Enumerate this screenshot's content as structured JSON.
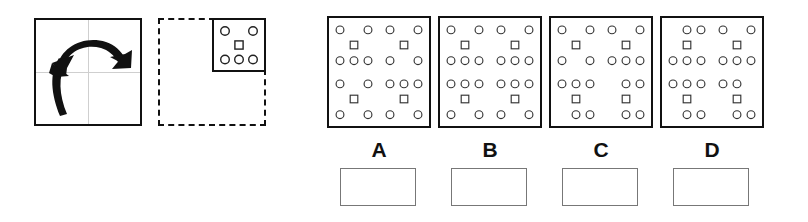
{
  "page": {
    "background_color": "#ffffff",
    "ink_color": "#111111",
    "glyph_color": "#333333",
    "answer_box_border_color": "#777777"
  },
  "prompt": {
    "rotation_box": {
      "name": "rotation-instruction-box",
      "border_style": "solid",
      "description": "Square frame containing two bold curved arrows indicating rotation",
      "arrow_count": 2,
      "arrows": [
        {
          "name": "upper-clockwise-arrow",
          "direction": "clockwise-right"
        },
        {
          "name": "lower-counterclockwise-arrow",
          "direction": "counterclockwise-up"
        }
      ],
      "axes_visible": true
    },
    "target_box": {
      "name": "dashed-target-box",
      "border_style": "dashed",
      "description": "Dashed square with a solid motif cell in the top-right quadrant",
      "motif_position": "top-right"
    }
  },
  "motif": {
    "name": "base-motif",
    "rows": [
      {
        "shape": "circle",
        "count": 2,
        "slots": [
          0,
          2
        ]
      },
      {
        "shape": "square",
        "count": 1,
        "slots": [
          1
        ]
      },
      {
        "shape": "circle",
        "count": 3,
        "slots": [
          0,
          1,
          2
        ]
      }
    ]
  },
  "options": [
    {
      "label": "A",
      "name": "option-a",
      "answer_box_value": "",
      "answer_box_placeholder": "",
      "quadrants": [
        {
          "name": "top-left",
          "rows": [
            {
              "shape": "circle",
              "slots": [
                0,
                2
              ]
            },
            {
              "shape": "square",
              "slots": [
                1
              ]
            },
            {
              "shape": "circle",
              "slots": [
                0,
                1,
                2
              ]
            }
          ]
        },
        {
          "name": "top-right",
          "rows": [
            {
              "shape": "circle",
              "slots": [
                0,
                2
              ]
            },
            {
              "shape": "square",
              "slots": [
                1
              ]
            },
            {
              "shape": "circle",
              "slots": [
                0,
                2
              ]
            }
          ]
        },
        {
          "name": "bottom-left",
          "rows": [
            {
              "shape": "circle",
              "slots": [
                0,
                2
              ]
            },
            {
              "shape": "square",
              "slots": [
                1
              ]
            },
            {
              "shape": "circle",
              "slots": [
                0,
                2
              ]
            }
          ]
        },
        {
          "name": "bottom-right",
          "rows": [
            {
              "shape": "circle",
              "slots": [
                0,
                1,
                2
              ]
            },
            {
              "shape": "square",
              "slots": [
                1
              ]
            },
            {
              "shape": "circle",
              "slots": [
                0,
                2
              ]
            }
          ]
        }
      ]
    },
    {
      "label": "B",
      "name": "option-b",
      "answer_box_value": "",
      "answer_box_placeholder": "",
      "quadrants": [
        {
          "name": "top-left",
          "rows": [
            {
              "shape": "circle",
              "slots": [
                0,
                2
              ]
            },
            {
              "shape": "square",
              "slots": [
                1
              ]
            },
            {
              "shape": "circle",
              "slots": [
                0,
                1,
                2
              ]
            }
          ]
        },
        {
          "name": "top-right",
          "rows": [
            {
              "shape": "circle",
              "slots": [
                0,
                2
              ]
            },
            {
              "shape": "square",
              "slots": [
                1
              ]
            },
            {
              "shape": "circle",
              "slots": [
                0,
                1,
                2
              ]
            }
          ]
        },
        {
          "name": "bottom-left",
          "rows": [
            {
              "shape": "circle",
              "slots": [
                0,
                1,
                2
              ]
            },
            {
              "shape": "square",
              "slots": [
                1
              ]
            },
            {
              "shape": "circle",
              "slots": [
                0,
                2
              ]
            }
          ]
        },
        {
          "name": "bottom-right",
          "rows": [
            {
              "shape": "circle",
              "slots": [
                0,
                1,
                2
              ]
            },
            {
              "shape": "square",
              "slots": [
                1
              ]
            },
            {
              "shape": "circle",
              "slots": [
                0,
                2
              ]
            }
          ]
        }
      ]
    },
    {
      "label": "C",
      "name": "option-c",
      "answer_box_value": "",
      "answer_box_placeholder": "",
      "quadrants": [
        {
          "name": "top-left",
          "rows": [
            {
              "shape": "circle",
              "slots": [
                0,
                2
              ]
            },
            {
              "shape": "square",
              "slots": [
                1
              ]
            },
            {
              "shape": "circle",
              "slots": [
                0,
                2
              ]
            }
          ]
        },
        {
          "name": "top-right",
          "rows": [
            {
              "shape": "circle",
              "slots": [
                0,
                2
              ]
            },
            {
              "shape": "square",
              "slots": [
                1
              ]
            },
            {
              "shape": "circle",
              "slots": [
                0,
                1,
                2
              ]
            }
          ]
        },
        {
          "name": "bottom-left",
          "rows": [
            {
              "shape": "circle",
              "slots": [
                0,
                1,
                2
              ]
            },
            {
              "shape": "square",
              "slots": [
                1
              ]
            },
            {
              "shape": "circle",
              "slots": [
                1,
                2
              ]
            }
          ]
        },
        {
          "name": "bottom-right",
          "rows": [
            {
              "shape": "circle",
              "slots": [
                1,
                2
              ]
            },
            {
              "shape": "square",
              "slots": [
                1
              ]
            },
            {
              "shape": "circle",
              "slots": [
                1,
                2
              ]
            }
          ]
        }
      ]
    },
    {
      "label": "D",
      "name": "option-d",
      "answer_box_value": "",
      "answer_box_placeholder": "",
      "quadrants": [
        {
          "name": "top-left",
          "rows": [
            {
              "shape": "circle",
              "slots": [
                1,
                2
              ]
            },
            {
              "shape": "square",
              "slots": [
                1
              ]
            },
            {
              "shape": "circle",
              "slots": [
                0,
                1,
                2
              ]
            }
          ]
        },
        {
          "name": "top-right",
          "rows": [
            {
              "shape": "circle",
              "slots": [
                0,
                2
              ]
            },
            {
              "shape": "square",
              "slots": [
                1
              ]
            },
            {
              "shape": "circle",
              "slots": [
                0,
                1,
                2
              ]
            }
          ]
        },
        {
          "name": "bottom-left",
          "rows": [
            {
              "shape": "circle",
              "slots": [
                0,
                1,
                2
              ]
            },
            {
              "shape": "square",
              "slots": [
                1
              ]
            },
            {
              "shape": "circle",
              "slots": [
                1,
                2
              ]
            }
          ]
        },
        {
          "name": "bottom-right",
          "rows": [
            {
              "shape": "circle",
              "slots": [
                0,
                1
              ]
            },
            {
              "shape": "square",
              "slots": [
                1
              ]
            },
            {
              "shape": "circle",
              "slots": [
                1,
                2
              ]
            }
          ]
        }
      ]
    }
  ]
}
